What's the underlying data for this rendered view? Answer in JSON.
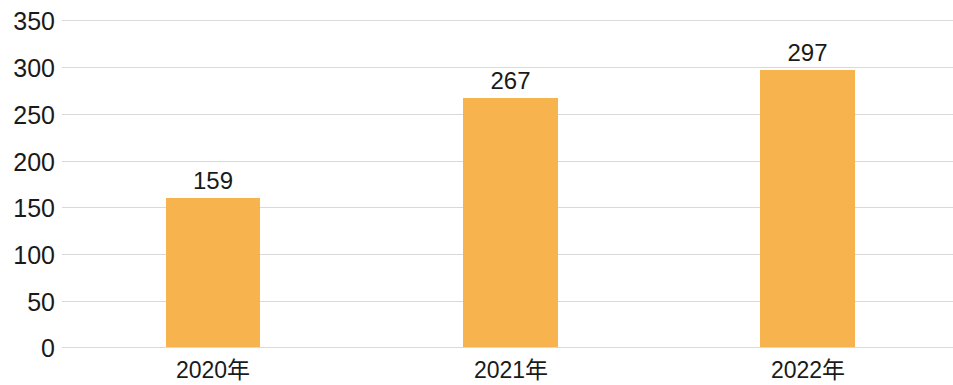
{
  "chart_data": {
    "type": "bar",
    "title": "",
    "subtitle": "",
    "xlabel": "",
    "ylabel": "",
    "categories": [
      "2020年",
      "2021年",
      "2022年"
    ],
    "values": [
      159,
      267,
      297
    ],
    "value_labels": [
      "159",
      "267",
      "297"
    ],
    "ylim": [
      0,
      350
    ],
    "ytick_labels": [
      "0",
      "50",
      "100",
      "150",
      "200",
      "250",
      "300",
      "350"
    ],
    "ytick_values": [
      0,
      50,
      100,
      150,
      200,
      250,
      300,
      350
    ],
    "grid": true,
    "grid_axis": "y",
    "legend": false,
    "legend_position": "none",
    "series": [
      {
        "name": "",
        "values": [
          159,
          267,
          297
        ],
        "color": "#f7b34e"
      }
    ],
    "colors": {
      "bar": "#f7b34e",
      "gridline": "#d9d9d9",
      "text": "#1a1a1a",
      "background": "#ffffff"
    }
  }
}
